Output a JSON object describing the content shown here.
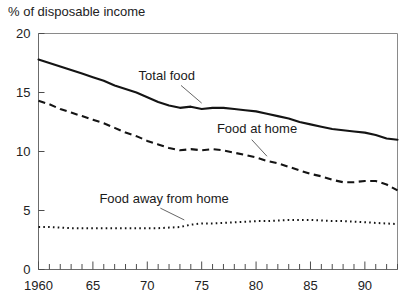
{
  "chart_data": {
    "type": "line",
    "title": "",
    "ylabel": "% of disposable income",
    "xlabel": "",
    "ylim": [
      0,
      20
    ],
    "yticks": [
      0,
      5,
      10,
      15,
      20
    ],
    "ytick_labels": [
      "0",
      "5",
      "10",
      "15",
      "20"
    ],
    "xlim": [
      1960,
      1993
    ],
    "xticks": [
      1960,
      1965,
      1970,
      1975,
      1980,
      1985,
      1990
    ],
    "xtick_labels": [
      "1960",
      "65",
      "70",
      "75",
      "80",
      "85",
      "90"
    ],
    "minor_xtick_step": 1,
    "grid": false,
    "legend_position": "inline-annotations",
    "x": [
      1960,
      1961,
      1962,
      1963,
      1964,
      1965,
      1966,
      1967,
      1968,
      1969,
      1970,
      1971,
      1972,
      1973,
      1974,
      1975,
      1976,
      1977,
      1978,
      1979,
      1980,
      1981,
      1982,
      1983,
      1984,
      1985,
      1986,
      1987,
      1988,
      1989,
      1990,
      1991,
      1992,
      1993
    ],
    "series": [
      {
        "name": "Total food",
        "style": "solid",
        "label": "Total food",
        "label_x": 1969.2,
        "label_y": 16.1,
        "leader": {
          "x1": 1973.1,
          "y1": 15.6,
          "x2": 1975.0,
          "y2": 14.1
        },
        "values": [
          17.8,
          17.5,
          17.2,
          16.9,
          16.6,
          16.3,
          16.0,
          15.6,
          15.3,
          15.0,
          14.6,
          14.2,
          13.9,
          13.7,
          13.8,
          13.6,
          13.7,
          13.7,
          13.6,
          13.5,
          13.4,
          13.2,
          13.0,
          12.8,
          12.5,
          12.3,
          12.1,
          11.9,
          11.8,
          11.7,
          11.6,
          11.4,
          11.1,
          11.0
        ]
      },
      {
        "name": "Food at home",
        "style": "dashed",
        "label": "Food at home",
        "label_x": 1976.4,
        "label_y": 11.6,
        "leader": {
          "x1": 1979.6,
          "y1": 11.0,
          "x2": 1981.0,
          "y2": 9.6
        },
        "values": [
          14.3,
          14.0,
          13.6,
          13.3,
          13.0,
          12.7,
          12.4,
          12.0,
          11.6,
          11.3,
          10.9,
          10.6,
          10.3,
          10.1,
          10.2,
          10.1,
          10.2,
          10.1,
          9.9,
          9.7,
          9.5,
          9.2,
          9.0,
          8.7,
          8.4,
          8.1,
          7.9,
          7.6,
          7.4,
          7.4,
          7.5,
          7.5,
          7.2,
          6.7
        ]
      },
      {
        "name": "Food away from home",
        "style": "dotted",
        "label": "Food away from home",
        "label_x": 1965.6,
        "label_y": 5.6,
        "leader": {
          "x1": 1971.2,
          "y1": 5.2,
          "x2": 1973.4,
          "y2": 4.2
        },
        "values": [
          3.6,
          3.6,
          3.55,
          3.5,
          3.5,
          3.5,
          3.5,
          3.5,
          3.5,
          3.5,
          3.5,
          3.5,
          3.55,
          3.6,
          3.8,
          3.9,
          3.9,
          3.95,
          4.0,
          4.05,
          4.1,
          4.1,
          4.15,
          4.2,
          4.2,
          4.2,
          4.15,
          4.1,
          4.1,
          4.05,
          4.0,
          3.95,
          3.9,
          3.85
        ]
      }
    ]
  }
}
